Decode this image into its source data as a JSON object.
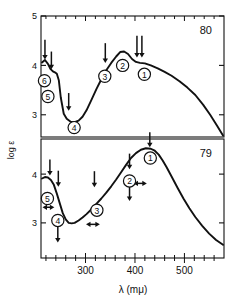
{
  "figure": {
    "name": "uv-visible-absorption-spectra",
    "ylabel": "log ε",
    "xlabel": "λ (mμ)",
    "xticklabels": [
      "300",
      "400",
      "500"
    ],
    "xtickvalues": [
      300,
      400,
      500
    ],
    "xlim": [
      210,
      580
    ],
    "xminor_step": 20
  },
  "chart_data": [
    {
      "type": "line",
      "panel_label": "80",
      "title": "",
      "xlabel": "λ (mμ)",
      "ylabel": "log ε",
      "xlim": [
        210,
        580
      ],
      "ylim": [
        2.55,
        5.0
      ],
      "yticklabels": [
        "5",
        "4",
        "3"
      ],
      "ytickvalues": [
        5,
        4,
        3
      ],
      "grid": false,
      "legend": "none",
      "x": [
        212,
        218,
        224,
        229,
        234,
        238,
        242,
        246,
        250,
        256,
        262,
        270,
        278,
        286,
        294,
        302,
        312,
        322,
        332,
        342,
        352,
        362,
        370,
        378,
        386,
        394,
        402,
        410,
        420,
        432,
        446,
        460,
        474,
        490,
        506,
        522,
        538,
        552,
        566,
        578
      ],
      "y": [
        4.06,
        4.11,
        4.03,
        3.93,
        3.88,
        3.86,
        3.83,
        3.7,
        3.35,
        3.02,
        2.92,
        2.86,
        2.85,
        2.88,
        2.96,
        3.09,
        3.3,
        3.52,
        3.72,
        3.9,
        4.05,
        4.18,
        4.27,
        4.28,
        4.23,
        4.13,
        4.07,
        4.05,
        4.04,
        4.0,
        3.94,
        3.87,
        3.79,
        3.68,
        3.55,
        3.4,
        3.2,
        3.0,
        2.78,
        2.58
      ],
      "markers": [
        {
          "label": "1",
          "cx": 419,
          "cy": 3.82
        },
        {
          "label": "2",
          "cx": 375,
          "cy": 4.0
        },
        {
          "label": "3",
          "cx": 339,
          "cy": 3.78
        },
        {
          "label": "4",
          "cx": 277,
          "cy": 2.74
        },
        {
          "label": "5",
          "cx": 224,
          "cy": 3.37
        },
        {
          "label": "6",
          "cx": 217,
          "cy": 3.69
        }
      ],
      "arrows": [
        {
          "kind": "down",
          "x": 218,
          "y_top": 4.52,
          "y_tip": 4.12
        },
        {
          "kind": "down",
          "x": 231,
          "y_top": 4.28,
          "y_tip": 3.92
        },
        {
          "kind": "down",
          "x": 266,
          "y_top": 3.44,
          "y_tip": 3.08
        },
        {
          "kind": "down",
          "x": 340,
          "y_top": 4.45,
          "y_tip": 4.05
        },
        {
          "kind": "down",
          "x": 404,
          "y_top": 4.6,
          "y_tip": 4.16
        },
        {
          "kind": "down",
          "x": 414,
          "y_top": 4.6,
          "y_tip": 4.16
        }
      ]
    },
    {
      "type": "line",
      "panel_label": "79",
      "title": "",
      "xlabel": "λ (mμ)",
      "ylabel": "log ε",
      "xlim": [
        210,
        580
      ],
      "ylim": [
        2.28,
        4.72
      ],
      "yticklabels": [
        "4",
        "3"
      ],
      "ytickvalues": [
        4,
        3
      ],
      "grid": false,
      "legend": "none",
      "x": [
        212,
        218,
        224,
        230,
        236,
        242,
        248,
        254,
        260,
        266,
        272,
        278,
        286,
        294,
        302,
        312,
        322,
        332,
        342,
        352,
        362,
        372,
        382,
        392,
        402,
        412,
        422,
        432,
        440,
        448,
        456,
        464,
        474,
        486,
        498,
        510,
        522,
        536,
        550,
        564,
        578
      ],
      "y": [
        3.91,
        3.94,
        3.93,
        3.88,
        3.78,
        3.6,
        3.4,
        3.2,
        3.07,
        3.0,
        2.99,
        3.0,
        3.05,
        3.11,
        3.18,
        3.28,
        3.39,
        3.5,
        3.62,
        3.75,
        3.89,
        4.04,
        4.19,
        4.33,
        4.43,
        4.5,
        4.53,
        4.52,
        4.48,
        4.4,
        4.28,
        4.14,
        3.95,
        3.72,
        3.5,
        3.3,
        3.12,
        2.94,
        2.78,
        2.65,
        2.55
      ],
      "markers": [
        {
          "label": "1",
          "cx": 431,
          "cy": 4.33
        },
        {
          "label": "2",
          "cx": 389,
          "cy": 3.86
        },
        {
          "label": "3",
          "cx": 323,
          "cy": 3.26
        },
        {
          "label": "4",
          "cx": 244,
          "cy": 3.05
        },
        {
          "label": "5",
          "cx": 223,
          "cy": 3.5
        }
      ],
      "arrows": [
        {
          "kind": "down",
          "x": 228,
          "y_top": 4.3,
          "y_tip": 3.97
        },
        {
          "kind": "down",
          "x": 245,
          "y_top": 4.07,
          "y_tip": 3.74
        },
        {
          "kind": "down",
          "x": 244,
          "y_top": 2.92,
          "y_tip": 2.6
        },
        {
          "kind": "down",
          "x": 318,
          "y_top": 4.06,
          "y_tip": 3.73
        },
        {
          "kind": "down",
          "x": 389,
          "y_top": 4.42,
          "y_tip": 4.1
        },
        {
          "kind": "down",
          "x": 389,
          "y_top": 3.76,
          "y_tip": 3.45
        },
        {
          "kind": "down",
          "x": 430,
          "y_top": 4.86,
          "y_tip": 4.55
        }
      ],
      "double_arrows": [
        {
          "x_left": 213,
          "x_right": 237,
          "y": 3.32
        },
        {
          "x_left": 301,
          "x_right": 329,
          "y": 2.97
        },
        {
          "x_left": 397,
          "x_right": 424,
          "y": 3.81
        }
      ]
    }
  ]
}
